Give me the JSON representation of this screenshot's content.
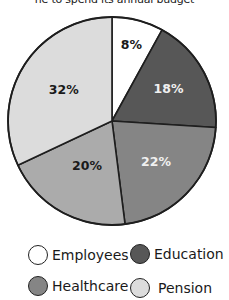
{
  "caption": "ne to spend its annual budget",
  "chart_data": {
    "type": "pie",
    "title": "",
    "start_angle_deg": 0,
    "direction": "clockwise",
    "slices": [
      {
        "label": "Employees",
        "value": 8,
        "display": "8%",
        "color": "#ffffff",
        "text_color": "#1a1a1a"
      },
      {
        "label": "Education",
        "value": 18,
        "display": "18%",
        "color": "#575757",
        "text_color": "#f0f0f0"
      },
      {
        "label": "Healthcare",
        "value": 22,
        "display": "22%",
        "color": "#858585",
        "text_color": "#f0f0f0"
      },
      {
        "label": "",
        "value": 20,
        "display": "20%",
        "color": "#ababab",
        "text_color": "#1a1a1a"
      },
      {
        "label": "Pension",
        "value": 32,
        "display": "32%",
        "color": "#dcdcdc",
        "text_color": "#1a1a1a"
      }
    ],
    "legend": {
      "position": "bottom",
      "entries": [
        {
          "label": "Employees",
          "color": "#ffffff"
        },
        {
          "label": "Education",
          "color": "#575757"
        },
        {
          "label": "Healthcare",
          "color": "#858585"
        },
        {
          "label": "Pension",
          "color": "#dcdcdc"
        }
      ]
    }
  }
}
